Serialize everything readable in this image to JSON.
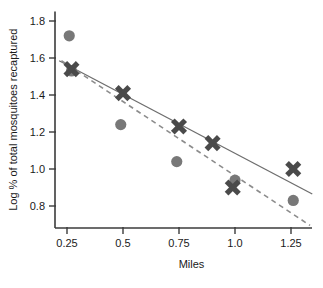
{
  "chart_data": {
    "type": "scatter",
    "title": "",
    "xlabel": "Miles",
    "ylabel": "Log % of total mosquitoes recaptured",
    "xlim": [
      0.17,
      1.36
    ],
    "ylim": [
      0.68,
      1.83
    ],
    "xticks": [
      "0.25",
      "0.5",
      "0.75",
      "1.0",
      "1.25"
    ],
    "xtick_values": [
      0.25,
      0.5,
      0.75,
      1.0,
      1.25
    ],
    "yticks": [
      "0.8",
      "1.0",
      "1.2",
      "1.4",
      "1.6",
      "1.8"
    ],
    "ytick_values": [
      0.8,
      1.0,
      1.2,
      1.4,
      1.6,
      1.8
    ],
    "grid": false,
    "legend": "none",
    "series": [
      {
        "name": "circle-series",
        "marker": "circle",
        "color": "#787878",
        "points": [
          {
            "x": 0.26,
            "y": 1.72
          },
          {
            "x": 0.27,
            "y": 1.53
          },
          {
            "x": 0.49,
            "y": 1.24
          },
          {
            "x": 0.74,
            "y": 1.04
          },
          {
            "x": 1.0,
            "y": 0.94
          },
          {
            "x": 1.26,
            "y": 0.83
          }
        ]
      },
      {
        "name": "cross-series",
        "marker": "x",
        "color": "#4a4a4a",
        "points": [
          {
            "x": 0.27,
            "y": 1.54
          },
          {
            "x": 0.5,
            "y": 1.41
          },
          {
            "x": 0.75,
            "y": 1.23
          },
          {
            "x": 0.9,
            "y": 1.14
          },
          {
            "x": 0.99,
            "y": 0.9
          },
          {
            "x": 1.26,
            "y": 1.0
          }
        ]
      }
    ],
    "fit_lines": [
      {
        "name": "solid-regression-line",
        "style": "solid",
        "color": "#6e6e6e",
        "x_start": 0.215,
        "y_start": 1.585,
        "x_end": 1.345,
        "y_end": 0.865
      },
      {
        "name": "dashed-regression-line",
        "style": "dashed",
        "color": "#8c8c8c",
        "x_start": 0.225,
        "y_start": 1.585,
        "x_end": 1.335,
        "y_end": 0.695
      }
    ]
  }
}
